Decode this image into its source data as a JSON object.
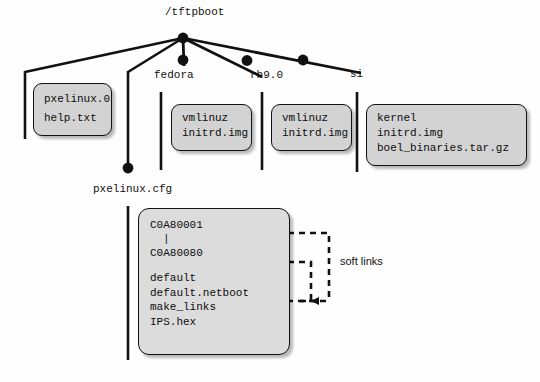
{
  "diagram": {
    "root": {
      "label": "/tftpboot"
    },
    "branch_labels": {
      "fedora": "fedora",
      "rh9": "rh9.0",
      "si": "si",
      "pxelinux_cfg": "pxelinux.cfg"
    },
    "boxes": {
      "pxelinux": {
        "name": "pxelinux-files-box",
        "lines": [
          "pxelinux.0",
          "help.txt"
        ]
      },
      "fedora": {
        "name": "fedora-files-box",
        "lines": [
          "vmlinuz",
          "initrd.img"
        ]
      },
      "rh9": {
        "name": "rh9-files-box",
        "lines": [
          "vmlinuz",
          "initrd.img"
        ]
      },
      "si": {
        "name": "si-files-box",
        "lines": [
          "kernel",
          "initrd.img",
          "boel_binaries.tar.gz"
        ]
      },
      "config": {
        "name": "pxelinux-cfg-files-box",
        "range_first": "C0A80001",
        "range_sep": "|",
        "range_last": "C0A80080",
        "lines": [
          "default",
          "default.netboot",
          "make_links",
          "IPS.hex"
        ]
      }
    },
    "annotations": {
      "soft_links": "soft links"
    },
    "colors": {
      "box_fill": "#d3d3d3",
      "config_fill": "#dcdcdc",
      "stroke": "#111111",
      "background": "#fefefe",
      "text": "#0d0d0d"
    }
  }
}
